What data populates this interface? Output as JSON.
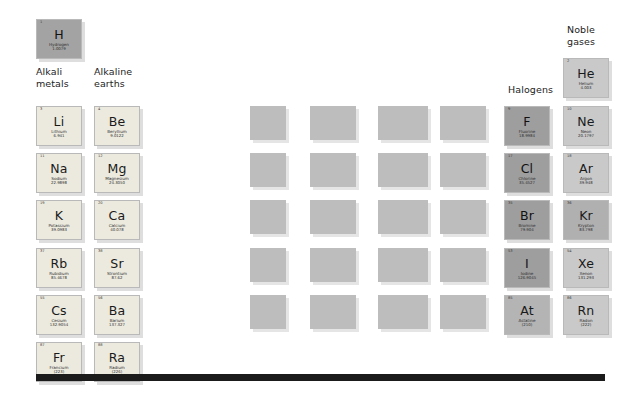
{
  "page": {
    "background_color": "#ffffff",
    "bottom_bar_color": "#1b1b1b"
  },
  "group_labels": [
    {
      "id": "alkali-metals",
      "text": "Alkali\nmetals",
      "x": 36,
      "y": 66
    },
    {
      "id": "alkaline-earths",
      "text": "Alkaline\nearths",
      "x": 94,
      "y": 66
    },
    {
      "id": "halogens",
      "text": "Halogens",
      "x": 508,
      "y": 84
    },
    {
      "id": "noble-gases",
      "text": "Noble\ngases",
      "x": 567,
      "y": 24
    }
  ],
  "elements": [
    {
      "number": "1",
      "symbol": "H",
      "name": "Hydrogen",
      "weight": "1.0079",
      "group": "hydrogen",
      "style": "c-hydrogen",
      "x": 36,
      "y": 19
    },
    {
      "number": "3",
      "symbol": "Li",
      "name": "Lithium",
      "weight": "6.941",
      "group": "alkali",
      "style": "c-alkali",
      "x": 36,
      "y": 106
    },
    {
      "number": "11",
      "symbol": "Na",
      "name": "Sodium",
      "weight": "22.9898",
      "group": "alkali",
      "style": "c-alkali",
      "x": 36,
      "y": 153
    },
    {
      "number": "19",
      "symbol": "K",
      "name": "Potassium",
      "weight": "39.0983",
      "group": "alkali",
      "style": "c-alkali",
      "x": 36,
      "y": 200
    },
    {
      "number": "37",
      "symbol": "Rb",
      "name": "Rubidium",
      "weight": "85.4678",
      "group": "alkali",
      "style": "c-alkali",
      "x": 36,
      "y": 248
    },
    {
      "number": "55",
      "symbol": "Cs",
      "name": "Cesium",
      "weight": "132.9054",
      "group": "alkali",
      "style": "c-alkali",
      "x": 36,
      "y": 295
    },
    {
      "number": "87",
      "symbol": "Fr",
      "name": "Francium",
      "weight": "(223)",
      "group": "alkali",
      "style": "c-alkali",
      "x": 36,
      "y": 342
    },
    {
      "number": "4",
      "symbol": "Be",
      "name": "Beryllium",
      "weight": "9.0122",
      "group": "alkaline",
      "style": "c-alkaline",
      "x": 94,
      "y": 106
    },
    {
      "number": "12",
      "symbol": "Mg",
      "name": "Magnesium",
      "weight": "24.3050",
      "group": "alkaline",
      "style": "c-alkaline",
      "x": 94,
      "y": 153
    },
    {
      "number": "20",
      "symbol": "Ca",
      "name": "Calcium",
      "weight": "40.078",
      "group": "alkaline",
      "style": "c-alkaline",
      "x": 94,
      "y": 200
    },
    {
      "number": "38",
      "symbol": "Sr",
      "name": "Strontium",
      "weight": "87.62",
      "group": "alkaline",
      "style": "c-alkaline",
      "x": 94,
      "y": 248
    },
    {
      "number": "56",
      "symbol": "Ba",
      "name": "Barium",
      "weight": "137.327",
      "group": "alkaline",
      "style": "c-alkaline",
      "x": 94,
      "y": 295
    },
    {
      "number": "88",
      "symbol": "Ra",
      "name": "Radium",
      "weight": "(226)",
      "group": "alkaline",
      "style": "c-alkaline",
      "x": 94,
      "y": 342
    },
    {
      "number": "9",
      "symbol": "F",
      "name": "Fluorine",
      "weight": "18.9984",
      "group": "halogen",
      "style": "c-halogen",
      "x": 504,
      "y": 106
    },
    {
      "number": "17",
      "symbol": "Cl",
      "name": "Chlorine",
      "weight": "35.4527",
      "group": "halogen",
      "style": "c-halogen",
      "x": 504,
      "y": 153
    },
    {
      "number": "35",
      "symbol": "Br",
      "name": "Bromine",
      "weight": "79.904",
      "group": "halogen",
      "style": "c-halogen",
      "x": 504,
      "y": 200
    },
    {
      "number": "53",
      "symbol": "I",
      "name": "Iodine",
      "weight": "126.9045",
      "group": "halogen",
      "style": "c-halogen",
      "x": 504,
      "y": 248
    },
    {
      "number": "85",
      "symbol": "At",
      "name": "Astatine",
      "weight": "(210)",
      "group": "halogen",
      "style": "c-halogen-lt",
      "x": 504,
      "y": 295
    },
    {
      "number": "2",
      "symbol": "He",
      "name": "Helium",
      "weight": "4.003",
      "group": "noble",
      "style": "c-noble",
      "x": 563,
      "y": 58
    },
    {
      "number": "10",
      "symbol": "Ne",
      "name": "Neon",
      "weight": "20.1797",
      "group": "noble",
      "style": "c-noble",
      "x": 563,
      "y": 106
    },
    {
      "number": "18",
      "symbol": "Ar",
      "name": "Argon",
      "weight": "39.948",
      "group": "noble",
      "style": "c-noble",
      "x": 563,
      "y": 153
    },
    {
      "number": "36",
      "symbol": "Kr",
      "name": "Krypton",
      "weight": "83.798",
      "group": "noble",
      "style": "c-noble-dk",
      "x": 563,
      "y": 200
    },
    {
      "number": "54",
      "symbol": "Xe",
      "name": "Xenon",
      "weight": "131.293",
      "group": "noble",
      "style": "c-noble",
      "x": 563,
      "y": 248
    },
    {
      "number": "86",
      "symbol": "Rn",
      "name": "Radon",
      "weight": "(222)",
      "group": "noble",
      "style": "c-noble",
      "x": 563,
      "y": 295
    }
  ],
  "blank_blocks": [
    {
      "x": 250,
      "y": 106,
      "w": 36,
      "h": 34
    },
    {
      "x": 310,
      "y": 106,
      "w": 46,
      "h": 34
    },
    {
      "x": 378,
      "y": 106,
      "w": 50,
      "h": 34
    },
    {
      "x": 440,
      "y": 106,
      "w": 46,
      "h": 34
    },
    {
      "x": 250,
      "y": 153,
      "w": 36,
      "h": 34
    },
    {
      "x": 310,
      "y": 153,
      "w": 46,
      "h": 34
    },
    {
      "x": 378,
      "y": 153,
      "w": 50,
      "h": 34
    },
    {
      "x": 440,
      "y": 153,
      "w": 46,
      "h": 34
    },
    {
      "x": 250,
      "y": 200,
      "w": 36,
      "h": 34
    },
    {
      "x": 310,
      "y": 200,
      "w": 46,
      "h": 34
    },
    {
      "x": 378,
      "y": 200,
      "w": 50,
      "h": 34
    },
    {
      "x": 440,
      "y": 200,
      "w": 46,
      "h": 34
    },
    {
      "x": 250,
      "y": 248,
      "w": 36,
      "h": 34
    },
    {
      "x": 310,
      "y": 248,
      "w": 46,
      "h": 34
    },
    {
      "x": 378,
      "y": 248,
      "w": 50,
      "h": 34
    },
    {
      "x": 440,
      "y": 248,
      "w": 46,
      "h": 34
    },
    {
      "x": 250,
      "y": 295,
      "w": 36,
      "h": 34
    },
    {
      "x": 310,
      "y": 295,
      "w": 46,
      "h": 34
    },
    {
      "x": 378,
      "y": 295,
      "w": 50,
      "h": 34
    },
    {
      "x": 440,
      "y": 295,
      "w": 46,
      "h": 34
    }
  ]
}
